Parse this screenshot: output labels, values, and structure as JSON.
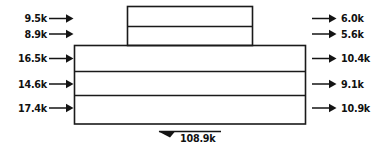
{
  "diagram": {
    "type": "flow-diagram",
    "title": "",
    "units": "k",
    "upper_block": {
      "name": "upper-block",
      "rows": [
        {
          "name": "upper-row-1",
          "input": {
            "label": "9.5k",
            "value": 9.5,
            "direction": "right"
          },
          "output": {
            "label": "6.0k",
            "value": 6.0,
            "direction": "right"
          }
        },
        {
          "name": "upper-row-2",
          "input": {
            "label": "8.9k",
            "value": 8.9,
            "direction": "right"
          },
          "output": {
            "label": "5.6k",
            "value": 5.6,
            "direction": "right"
          }
        }
      ]
    },
    "lower_block": {
      "name": "lower-block",
      "rows": [
        {
          "name": "lower-row-1",
          "input": {
            "label": "16.5k",
            "value": 16.5,
            "direction": "right"
          },
          "output": {
            "label": "10.4k",
            "value": 10.4,
            "direction": "right"
          }
        },
        {
          "name": "lower-row-2",
          "input": {
            "label": "14.6k",
            "value": 14.6,
            "direction": "right"
          },
          "output": {
            "label": "9.1k",
            "value": 9.1,
            "direction": "right"
          }
        },
        {
          "name": "lower-row-3",
          "input": {
            "label": "17.4k",
            "value": 17.4,
            "direction": "right"
          },
          "output": {
            "label": "10.9k",
            "value": 10.9,
            "direction": "right"
          }
        }
      ]
    },
    "total": {
      "label": "108.9k",
      "value": 108.9,
      "direction": "left"
    },
    "colors": {
      "stroke": "#1a1a1a",
      "text": "#111111",
      "background": "#ffffff"
    }
  }
}
